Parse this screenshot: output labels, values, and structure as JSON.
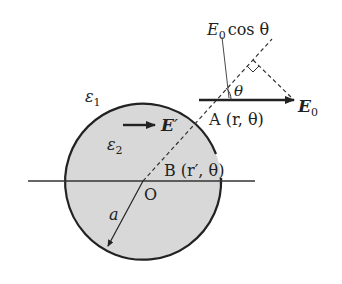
{
  "diagram": {
    "labels": {
      "eps1": "ε",
      "eps1_sub": "1",
      "eps2": "ε",
      "eps2_sub": "2",
      "E_prime": "E",
      "E_prime_mark": "′",
      "E0": "E",
      "E0_sub": "0",
      "E0cos_E": "E",
      "E0cos_sub": "0",
      "E0cos_rest": "cos θ",
      "theta": "θ",
      "A_point": "A (r, θ)",
      "B_point": "B (r′, θ)",
      "origin": "O",
      "radius": "a"
    },
    "colors": {
      "sphere_fill": "#d8d8d8",
      "stroke": "#222222"
    }
  }
}
